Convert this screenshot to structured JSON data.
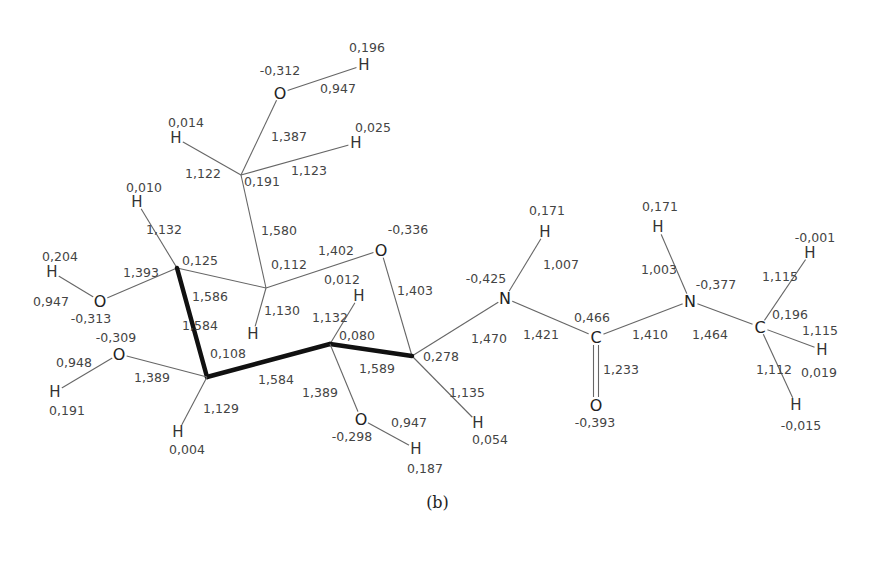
{
  "figure": {
    "caption": "(b)"
  },
  "atoms": [
    {
      "id": "O6",
      "el": "O",
      "x": 280,
      "y": 93,
      "charge": "-0,312",
      "cx": 280,
      "cy": 70
    },
    {
      "id": "H6O",
      "el": "H",
      "x": 364,
      "y": 65,
      "charge": "0,196",
      "cx": 367,
      "cy": 47
    },
    {
      "id": "C6",
      "el": "C",
      "x": 241,
      "y": 175,
      "charge": "0,191",
      "cx": 262,
      "cy": 181,
      "hidden": true
    },
    {
      "id": "H6a",
      "el": "H",
      "x": 176,
      "y": 138,
      "charge": "0,014",
      "cx": 186,
      "cy": 122
    },
    {
      "id": "H6b",
      "el": "H",
      "x": 356,
      "y": 143,
      "charge": "0,025",
      "cx": 373,
      "cy": 127
    },
    {
      "id": "C4",
      "el": "C",
      "x": 177,
      "y": 268,
      "charge": "0,125",
      "cx": 200,
      "cy": 260,
      "hidden": true
    },
    {
      "id": "H4",
      "el": "H",
      "x": 137,
      "y": 202,
      "charge": "0,010",
      "cx": 144,
      "cy": 187
    },
    {
      "id": "O4",
      "el": "O",
      "x": 100,
      "y": 301,
      "charge": "-0,313",
      "cx": 91,
      "cy": 318
    },
    {
      "id": "H4O",
      "el": "H",
      "x": 52,
      "y": 272,
      "charge": "0,204",
      "cx": 60,
      "cy": 256
    },
    {
      "id": "C5",
      "el": "C",
      "x": 266,
      "y": 288,
      "charge": "0,112",
      "cx": 289,
      "cy": 264,
      "hidden": true
    },
    {
      "id": "H5",
      "el": "H",
      "x": 253,
      "y": 334,
      "charge": "",
      "cx": 0,
      "cy": 0
    },
    {
      "id": "Or",
      "el": "O",
      "x": 381,
      "y": 250,
      "charge": "-0,336",
      "cx": 408,
      "cy": 229
    },
    {
      "id": "C2",
      "el": "C",
      "x": 330,
      "y": 344,
      "charge": "0,080",
      "cx": 357,
      "cy": 335,
      "hidden": true
    },
    {
      "id": "H2",
      "el": "H",
      "x": 359,
      "y": 296,
      "charge": "0,012",
      "cx": 342,
      "cy": 279
    },
    {
      "id": "C1",
      "el": "C",
      "x": 412,
      "y": 356,
      "charge": "0,278",
      "cx": 441,
      "cy": 356,
      "hidden": true
    },
    {
      "id": "H1",
      "el": "H",
      "x": 478,
      "y": 423,
      "charge": "0,054",
      "cx": 490,
      "cy": 439
    },
    {
      "id": "C3",
      "el": "C",
      "x": 207,
      "y": 377,
      "charge": "0,108",
      "cx": 228,
      "cy": 353,
      "hidden": true
    },
    {
      "id": "O3",
      "el": "O",
      "x": 119,
      "y": 354,
      "charge": "-0,309",
      "cx": 116,
      "cy": 337
    },
    {
      "id": "H3O",
      "el": "H",
      "x": 55,
      "y": 392,
      "charge": "0,191",
      "cx": 67,
      "cy": 410
    },
    {
      "id": "H3",
      "el": "H",
      "x": 178,
      "y": 432,
      "charge": "0,004",
      "cx": 187,
      "cy": 449
    },
    {
      "id": "O2",
      "el": "O",
      "x": 361,
      "y": 419,
      "charge": "-0,298",
      "cx": 352,
      "cy": 436
    },
    {
      "id": "H2O",
      "el": "H",
      "x": 416,
      "y": 449,
      "charge": "0,187",
      "cx": 425,
      "cy": 468
    },
    {
      "id": "N1",
      "el": "N",
      "x": 505,
      "y": 298,
      "charge": "-0,425",
      "cx": 486,
      "cy": 278
    },
    {
      "id": "HN1",
      "el": "H",
      "x": 545,
      "y": 232,
      "charge": "0,171",
      "cx": 547,
      "cy": 210
    },
    {
      "id": "Cc",
      "el": "C",
      "x": 596,
      "y": 337,
      "charge": "0,466",
      "cx": 592,
      "cy": 317
    },
    {
      "id": "Oc",
      "el": "O",
      "x": 596,
      "y": 405,
      "charge": "-0,393",
      "cx": 595,
      "cy": 422
    },
    {
      "id": "N2",
      "el": "N",
      "x": 690,
      "y": 301,
      "charge": "-0,377",
      "cx": 716,
      "cy": 284
    },
    {
      "id": "HN2",
      "el": "H",
      "x": 658,
      "y": 227,
      "charge": "0,171",
      "cx": 660,
      "cy": 206
    },
    {
      "id": "Cm",
      "el": "C",
      "x": 760,
      "y": 327,
      "charge": "0,196",
      "cx": 790,
      "cy": 314
    },
    {
      "id": "Hm1",
      "el": "H",
      "x": 810,
      "y": 253,
      "charge": "-0,001",
      "cx": 815,
      "cy": 237
    },
    {
      "id": "Hm2",
      "el": "H",
      "x": 822,
      "y": 350,
      "charge": "0,019",
      "cx": 819,
      "cy": 372
    },
    {
      "id": "Hm3",
      "el": "H",
      "x": 796,
      "y": 405,
      "charge": "-0,015",
      "cx": 801,
      "cy": 425
    }
  ],
  "bonds": [
    {
      "a": "O6",
      "b": "H6O",
      "len": "0,947",
      "lx": 338,
      "ly": 88
    },
    {
      "a": "C6",
      "b": "O6",
      "len": "1,387",
      "lx": 289,
      "ly": 136
    },
    {
      "a": "C6",
      "b": "H6a",
      "len": "1,122",
      "lx": 203,
      "ly": 173
    },
    {
      "a": "C6",
      "b": "H6b",
      "len": "1,123",
      "lx": 309,
      "ly": 170
    },
    {
      "a": "C6",
      "b": "C5",
      "len": "1,580",
      "lx": 279,
      "ly": 230
    },
    {
      "a": "C4",
      "b": "H4",
      "len": "1,132",
      "lx": 164,
      "ly": 229
    },
    {
      "a": "C4",
      "b": "O4",
      "len": "1,393",
      "lx": 141,
      "ly": 272
    },
    {
      "a": "O4",
      "b": "H4O",
      "len": "0,947",
      "lx": 51,
      "ly": 301
    },
    {
      "a": "C4",
      "b": "C5",
      "len": "1,586",
      "lx": 210,
      "ly": 296
    },
    {
      "a": "C5",
      "b": "Or",
      "len": "1,402",
      "lx": 336,
      "ly": 250
    },
    {
      "a": "C5",
      "b": "H5",
      "len": "1,130",
      "lx": 282,
      "ly": 310
    },
    {
      "a": "Or",
      "b": "C1",
      "len": "1,403",
      "lx": 415,
      "ly": 290
    },
    {
      "a": "C2",
      "b": "H2",
      "len": "1,132",
      "lx": 330,
      "ly": 317
    },
    {
      "a": "C1",
      "b": "H1",
      "len": "1,135",
      "lx": 467,
      "ly": 392
    },
    {
      "a": "C1",
      "b": "N1",
      "len": "1,470",
      "lx": 489,
      "ly": 338
    },
    {
      "a": "C2",
      "b": "C1",
      "len": "1,589",
      "lx": 377,
      "ly": 368,
      "bold": true
    },
    {
      "a": "C3",
      "b": "C2",
      "len": "1,584",
      "lx": 276,
      "ly": 379,
      "bold": true
    },
    {
      "a": "C4",
      "b": "C3",
      "len": "1,584",
      "lx": 200,
      "ly": 325,
      "bold": true
    },
    {
      "a": "C3",
      "b": "O3",
      "len": "1,389",
      "lx": 152,
      "ly": 377
    },
    {
      "a": "O3",
      "b": "H3O",
      "len": "0,948",
      "lx": 74,
      "ly": 362
    },
    {
      "a": "C3",
      "b": "H3",
      "len": "1,129",
      "lx": 221,
      "ly": 408
    },
    {
      "a": "C2",
      "b": "O2",
      "len": "1,389",
      "lx": 320,
      "ly": 392
    },
    {
      "a": "O2",
      "b": "H2O",
      "len": "0,947",
      "lx": 409,
      "ly": 422
    },
    {
      "a": "N1",
      "b": "HN1",
      "len": "1,007",
      "lx": 561,
      "ly": 264
    },
    {
      "a": "N1",
      "b": "Cc",
      "len": "1,421",
      "lx": 541,
      "ly": 334
    },
    {
      "a": "Cc",
      "b": "Oc",
      "len": "1,233",
      "lx": 621,
      "ly": 369,
      "double": true
    },
    {
      "a": "Cc",
      "b": "N2",
      "len": "1,410",
      "lx": 650,
      "ly": 334
    },
    {
      "a": "N2",
      "b": "HN2",
      "len": "1,003",
      "lx": 659,
      "ly": 269
    },
    {
      "a": "N2",
      "b": "Cm",
      "len": "1,464",
      "lx": 710,
      "ly": 334
    },
    {
      "a": "Cm",
      "b": "Hm1",
      "len": "1,115",
      "lx": 780,
      "ly": 276
    },
    {
      "a": "Cm",
      "b": "Hm2",
      "len": "1,115",
      "lx": 820,
      "ly": 330
    },
    {
      "a": "Cm",
      "b": "Hm3",
      "len": "1,112",
      "lx": 774,
      "ly": 369
    }
  ],
  "colors": {
    "bond": "#666666",
    "bold_bond": "#111111",
    "text": "#444444",
    "background": "#ffffff"
  }
}
